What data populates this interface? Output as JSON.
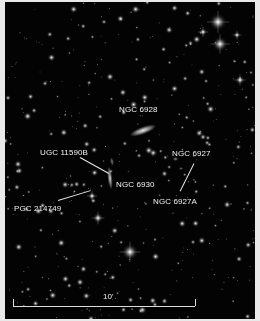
{
  "figure": {
    "kind": "astronomical-finder-chart",
    "background_color": "#030303",
    "border_color": "#e9e9e9",
    "width": 260,
    "height": 321
  },
  "labels": [
    {
      "id": "ngc6928",
      "text": "NGC 6928",
      "x": 119,
      "y": 105
    },
    {
      "id": "ugc11590b",
      "text": "UGC 11590B",
      "x": 40,
      "y": 148
    },
    {
      "id": "ngc6927",
      "text": "NGC 6927",
      "x": 172,
      "y": 149
    },
    {
      "id": "ngc6930",
      "text": "NGC 6930",
      "x": 116,
      "y": 180
    },
    {
      "id": "ngc6927a",
      "text": "NGC 6927A",
      "x": 153,
      "y": 197
    },
    {
      "id": "pgc214749",
      "text": "PGC 214749",
      "x": 14,
      "y": 204
    }
  ],
  "leaders": [
    {
      "id": "leader-ugc11590b",
      "x1": 80,
      "y1": 157,
      "x2": 109,
      "y2": 173
    },
    {
      "id": "leader-ngc6927a",
      "x1": 194,
      "y1": 163,
      "x2": 180,
      "y2": 191
    },
    {
      "id": "leader-pgc214749",
      "x1": 58,
      "y1": 200,
      "x2": 91,
      "y2": 190
    }
  ],
  "galaxies": [
    {
      "id": "ngc6928",
      "cx": 143,
      "cy": 130,
      "len": 26,
      "thick": 7,
      "angle": -20,
      "brightness": 0.95
    },
    {
      "id": "ngc6930",
      "cx": 110,
      "cy": 178,
      "len": 22,
      "thick": 4,
      "angle": 84,
      "brightness": 0.9
    },
    {
      "id": "ugc11590b",
      "cx": 112,
      "cy": 161,
      "len": 8,
      "thick": 3,
      "angle": 80,
      "brightness": 0.55
    },
    {
      "id": "ngc6927",
      "cx": 175,
      "cy": 159,
      "len": 5,
      "thick": 4,
      "angle": 0,
      "brightness": 0.5
    },
    {
      "id": "ngc6927a",
      "cx": 181,
      "cy": 168,
      "len": 4,
      "thick": 3,
      "angle": 0,
      "brightness": 0.4
    }
  ],
  "scale": {
    "label": "10'",
    "bar_x1": 13,
    "bar_x2": 195,
    "bar_y": 306,
    "tick_height": 7,
    "label_x": 103,
    "label_y": 292
  },
  "bright_stars": [
    {
      "x": 218,
      "y": 22,
      "r": 3.4
    },
    {
      "x": 220,
      "y": 44,
      "r": 3.0
    },
    {
      "x": 130,
      "y": 252,
      "r": 3.2
    },
    {
      "x": 203,
      "y": 32,
      "r": 1.6
    },
    {
      "x": 237,
      "y": 35,
      "r": 1.4
    },
    {
      "x": 98,
      "y": 218,
      "r": 2.0
    },
    {
      "x": 92,
      "y": 196,
      "r": 1.6
    },
    {
      "x": 240,
      "y": 80,
      "r": 1.8
    }
  ],
  "star_field": {
    "count": 430,
    "seed": 20240611,
    "min_radius": 0.35,
    "max_radius": 1.7,
    "color": "#ffffff"
  }
}
